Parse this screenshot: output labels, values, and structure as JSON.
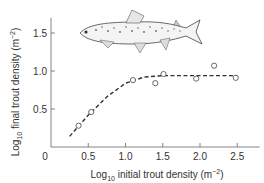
{
  "chart_data": {
    "type": "scatter",
    "title": "",
    "xlabel": "Log10 initial trout density (m^-2)",
    "ylabel": "Log10 final trout density (m^-2)",
    "xlabel_parts": {
      "pre": "Log",
      "sub": "10",
      "post": " initial trout density (m",
      "sup": "−2",
      "end": ")"
    },
    "ylabel_parts": {
      "pre": "Log",
      "sub": "10",
      "post": " final trout density (m",
      "sup": "−2",
      "end": ")"
    },
    "xlim": [
      0,
      2.8
    ],
    "ylim": [
      0,
      1.7
    ],
    "x_ticks": [
      "0",
      "0.5",
      "1.0",
      "1.5",
      "2.0",
      "2.5"
    ],
    "y_ticks": [
      "0.5",
      "1.0",
      "1.5"
    ],
    "grid": false,
    "legend": null,
    "series": [
      {
        "name": "observed",
        "style": "open-circle",
        "x": [
          0.37,
          0.54,
          1.1,
          1.4,
          1.51,
          1.95,
          2.19,
          2.48
        ],
        "y": [
          0.28,
          0.46,
          0.88,
          0.84,
          0.96,
          0.9,
          1.07,
          0.91
        ]
      },
      {
        "name": "fitted curve",
        "style": "dashed-line",
        "x": [
          0.25,
          0.5,
          0.75,
          1.0,
          1.25,
          1.5,
          1.75,
          2.0,
          2.25,
          2.5
        ],
        "y": [
          0.14,
          0.42,
          0.66,
          0.84,
          0.92,
          0.94,
          0.94,
          0.94,
          0.94,
          0.94
        ]
      }
    ],
    "annotations": [
      "brown trout illustration (upper center)"
    ]
  }
}
